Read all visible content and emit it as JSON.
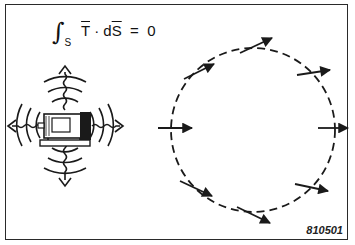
{
  "equation": {
    "integral_sign": "∫",
    "subscript": "S",
    "vector_T": "T",
    "dot": "·",
    "d": "d",
    "vector_S": "S",
    "equals": "=",
    "rhs": "0"
  },
  "figure_id": "810501",
  "left_illustration": {
    "description": "Motor radiating sound waves in all four directions",
    "arrow_directions": [
      "up",
      "down",
      "left",
      "right"
    ],
    "rings": 3
  },
  "right_illustration": {
    "description": "Dashed closed surface with sound intensity vectors crossing it",
    "surface": "dashed-circle",
    "vectors": 9
  },
  "colors": {
    "ink": "#1a1a1a",
    "background": "#ffffff",
    "frame": "#2a2a2a"
  }
}
